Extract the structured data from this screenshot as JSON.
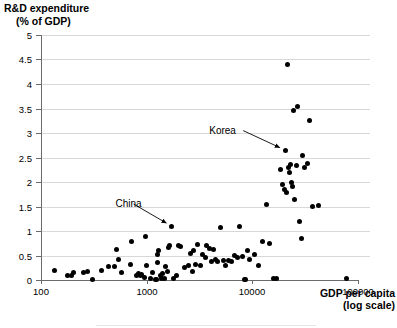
{
  "chart_data": {
    "type": "scatter",
    "title": "",
    "ylabel_line1": "R&D expenditure",
    "ylabel_line2": "(% of GDP)",
    "xlabel_line1": "GDP per capita",
    "xlabel_line2": "(log scale)",
    "xscale": "log",
    "xlim": [
      100,
      100000
    ],
    "ylim": [
      0,
      5
    ],
    "xticks": [
      100,
      1000,
      10000,
      100000
    ],
    "xtick_labels": [
      "100",
      "1000",
      "10000",
      "100000"
    ],
    "yticks": [
      0,
      0.5,
      1,
      1.5,
      2,
      2.5,
      3,
      3.5,
      4,
      4.5,
      5
    ],
    "ytick_labels": [
      "0",
      "0.5",
      "1",
      "1.5",
      "2",
      "2.5",
      "3",
      "3.5",
      "4",
      "4.5",
      "5"
    ],
    "grid": "horizontal",
    "legend": "none",
    "marker": "filled-circle-black",
    "annotations": [
      {
        "label": "Korea",
        "x": 20500,
        "y": 2.65,
        "label_x": 8200,
        "label_y": 3.05
      },
      {
        "label": "China",
        "x": 1720,
        "y": 1.1,
        "label_x": 750,
        "label_y": 1.55
      }
    ],
    "points": [
      {
        "x": 135,
        "y": 0.2
      },
      {
        "x": 178,
        "y": 0.1
      },
      {
        "x": 195,
        "y": 0.1
      },
      {
        "x": 205,
        "y": 0.15
      },
      {
        "x": 250,
        "y": 0.15
      },
      {
        "x": 275,
        "y": 0.17
      },
      {
        "x": 310,
        "y": 0.02
      },
      {
        "x": 375,
        "y": 0.2
      },
      {
        "x": 440,
        "y": 0.28
      },
      {
        "x": 500,
        "y": 0.27
      },
      {
        "x": 520,
        "y": 0.63
      },
      {
        "x": 540,
        "y": 0.42
      },
      {
        "x": 580,
        "y": 0.15
      },
      {
        "x": 700,
        "y": 0.32
      },
      {
        "x": 720,
        "y": 0.78
      },
      {
        "x": 800,
        "y": 0.1
      },
      {
        "x": 840,
        "y": 0.13
      },
      {
        "x": 870,
        "y": 0.1
      },
      {
        "x": 900,
        "y": 0.12
      },
      {
        "x": 960,
        "y": 0.05
      },
      {
        "x": 980,
        "y": 0.88
      },
      {
        "x": 1000,
        "y": 0.3
      },
      {
        "x": 1080,
        "y": 0.03
      },
      {
        "x": 1140,
        "y": 0.15
      },
      {
        "x": 1200,
        "y": 0.02
      },
      {
        "x": 1230,
        "y": 0.02
      },
      {
        "x": 1260,
        "y": 0.35
      },
      {
        "x": 1280,
        "y": 0.52
      },
      {
        "x": 1300,
        "y": 0.6
      },
      {
        "x": 1340,
        "y": 0.1
      },
      {
        "x": 1380,
        "y": 0.03
      },
      {
        "x": 1420,
        "y": 0.13
      },
      {
        "x": 1460,
        "y": 0.03
      },
      {
        "x": 1520,
        "y": 0.28
      },
      {
        "x": 1560,
        "y": 0.18
      },
      {
        "x": 1600,
        "y": 0.66
      },
      {
        "x": 1650,
        "y": 0.7
      },
      {
        "x": 1720,
        "y": 1.1
      },
      {
        "x": 1800,
        "y": 0.03
      },
      {
        "x": 1900,
        "y": 0.1
      },
      {
        "x": 2000,
        "y": 0.7
      },
      {
        "x": 2100,
        "y": 0.68
      },
      {
        "x": 2300,
        "y": 0.25
      },
      {
        "x": 2500,
        "y": 0.3
      },
      {
        "x": 2600,
        "y": 0.55
      },
      {
        "x": 2700,
        "y": 0.18
      },
      {
        "x": 2800,
        "y": 0.6
      },
      {
        "x": 2900,
        "y": 0.32
      },
      {
        "x": 3000,
        "y": 0.72
      },
      {
        "x": 3200,
        "y": 0.3
      },
      {
        "x": 3400,
        "y": 0.52
      },
      {
        "x": 3600,
        "y": 0.46
      },
      {
        "x": 3700,
        "y": 0.7
      },
      {
        "x": 3900,
        "y": 0.65
      },
      {
        "x": 4100,
        "y": 0.37
      },
      {
        "x": 4300,
        "y": 0.63
      },
      {
        "x": 4500,
        "y": 0.42
      },
      {
        "x": 4700,
        "y": 0.38
      },
      {
        "x": 5000,
        "y": 1.07
      },
      {
        "x": 5300,
        "y": 0.4
      },
      {
        "x": 5600,
        "y": 0.3
      },
      {
        "x": 6000,
        "y": 0.4
      },
      {
        "x": 6400,
        "y": 0.38
      },
      {
        "x": 6800,
        "y": 0.5
      },
      {
        "x": 7200,
        "y": 0.45
      },
      {
        "x": 7600,
        "y": 1.1
      },
      {
        "x": 8000,
        "y": 0.48
      },
      {
        "x": 8500,
        "y": 0.02
      },
      {
        "x": 8700,
        "y": 0.02
      },
      {
        "x": 9000,
        "y": 0.6
      },
      {
        "x": 9500,
        "y": 0.42
      },
      {
        "x": 10500,
        "y": 0.52
      },
      {
        "x": 11500,
        "y": 0.3
      },
      {
        "x": 12500,
        "y": 0.78
      },
      {
        "x": 13500,
        "y": 1.55
      },
      {
        "x": 14500,
        "y": 0.75
      },
      {
        "x": 16000,
        "y": 0.03
      },
      {
        "x": 17000,
        "y": 0.03
      },
      {
        "x": 18500,
        "y": 2.25
      },
      {
        "x": 19500,
        "y": 1.95
      },
      {
        "x": 20000,
        "y": 1.85
      },
      {
        "x": 20500,
        "y": 2.65
      },
      {
        "x": 21000,
        "y": 1.78
      },
      {
        "x": 21500,
        "y": 4.4
      },
      {
        "x": 22000,
        "y": 2.3
      },
      {
        "x": 22500,
        "y": 2.2
      },
      {
        "x": 23000,
        "y": 2.35
      },
      {
        "x": 23500,
        "y": 2.0
      },
      {
        "x": 24000,
        "y": 1.9
      },
      {
        "x": 24500,
        "y": 3.45
      },
      {
        "x": 25000,
        "y": 1.65
      },
      {
        "x": 26000,
        "y": 2.33
      },
      {
        "x": 27000,
        "y": 3.55
      },
      {
        "x": 28000,
        "y": 1.2
      },
      {
        "x": 29000,
        "y": 0.85
      },
      {
        "x": 30000,
        "y": 2.55
      },
      {
        "x": 31000,
        "y": 2.3
      },
      {
        "x": 33000,
        "y": 2.38
      },
      {
        "x": 35000,
        "y": 3.25
      },
      {
        "x": 37000,
        "y": 1.5
      },
      {
        "x": 42000,
        "y": 1.52
      },
      {
        "x": 78000,
        "y": 0.03
      }
    ]
  }
}
